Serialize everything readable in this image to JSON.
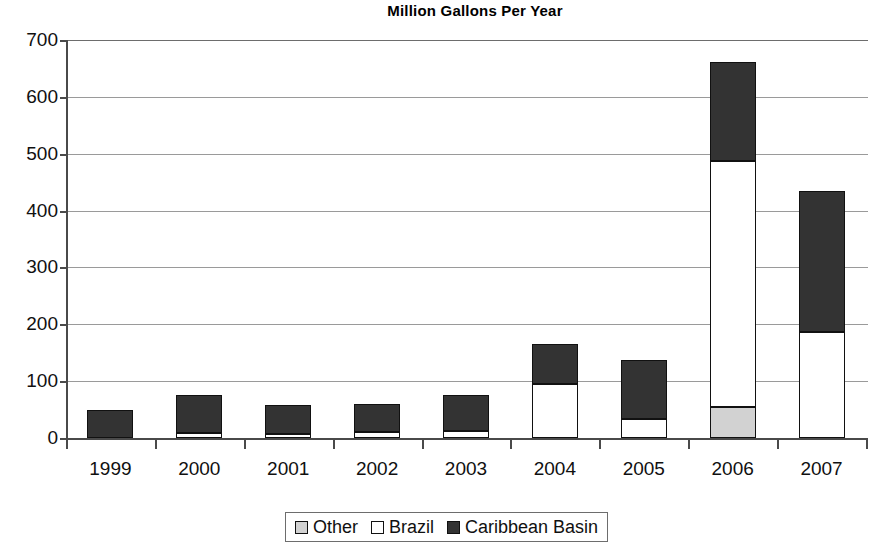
{
  "chart_data": {
    "type": "bar",
    "subtype": "stacked-vertical",
    "title": "Million Gallons Per Year",
    "xlabel": "",
    "ylabel": "",
    "ylim": [
      0,
      700
    ],
    "ytick_step": 100,
    "yticks": [
      700,
      600,
      500,
      400,
      300,
      200,
      100,
      0
    ],
    "ytick_labels": [
      "700",
      "600",
      "500",
      "400",
      "300",
      "200",
      "100",
      "0"
    ],
    "grid": true,
    "grid_axis": "y",
    "legend_position": "bottom-center",
    "categories": [
      "1999",
      "2000",
      "2001",
      "2002",
      "2003",
      "2004",
      "2005",
      "2006",
      "2007"
    ],
    "series": [
      {
        "name": "Other",
        "color": "#d2d2d2",
        "values": [
          0,
          0,
          0,
          0,
          0,
          0,
          0,
          55,
          0
        ]
      },
      {
        "name": "Brazil",
        "color": "#ffffff",
        "values": [
          0,
          8,
          7,
          10,
          12,
          95,
          33,
          432,
          187
        ]
      },
      {
        "name": "Caribbean Basin",
        "color": "#333333",
        "values": [
          50,
          67,
          51,
          50,
          64,
          70,
          105,
          174,
          247
        ]
      }
    ],
    "totals": [
      50,
      75,
      58,
      60,
      76,
      165,
      138,
      661,
      442
    ]
  },
  "title": {
    "text": "Million Gallons Per Year"
  },
  "legend": {
    "entries": [
      {
        "label": "Other",
        "swatch": "light-gray-swatch",
        "color": "#d2d2d2"
      },
      {
        "label": "Brazil",
        "swatch": "white-swatch",
        "color": "#ffffff"
      },
      {
        "label": "Caribbean Basin",
        "swatch": "dark-swatch",
        "color": "#333333"
      }
    ]
  }
}
